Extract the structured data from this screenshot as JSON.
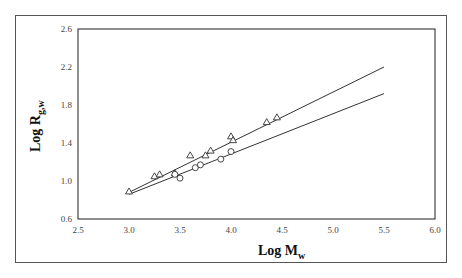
{
  "chart_data": {
    "type": "scatter",
    "title": "",
    "xlabel": "Log M_w",
    "ylabel": "Log R_g,w",
    "xlim": [
      2.5,
      6.0
    ],
    "ylim": [
      0.6,
      2.6
    ],
    "xticks": [
      "2.5",
      "3.0",
      "3.5",
      "4.0",
      "4.5",
      "5.0",
      "5.5",
      "6.0"
    ],
    "yticks": [
      "0.6",
      "1.0",
      "1.4",
      "1.8",
      "2.2",
      "2.6"
    ],
    "grid": false,
    "legend": null,
    "series": [
      {
        "name": "triangles",
        "marker": "triangle",
        "x": [
          3.0,
          3.25,
          3.3,
          3.45,
          3.6,
          3.75,
          3.8,
          4.0,
          4.02,
          4.35,
          4.45
        ],
        "y": [
          0.89,
          1.05,
          1.07,
          1.08,
          1.27,
          1.27,
          1.32,
          1.47,
          1.43,
          1.62,
          1.67
        ]
      },
      {
        "name": "circles",
        "marker": "circle",
        "x": [
          3.45,
          3.5,
          3.65,
          3.7,
          3.9,
          4.0
        ],
        "y": [
          1.07,
          1.03,
          1.14,
          1.17,
          1.23,
          1.31
        ]
      }
    ],
    "fit_lines": [
      {
        "name": "upper-fit",
        "x": [
          3.0,
          5.5
        ],
        "y": [
          0.88,
          2.2
        ]
      },
      {
        "name": "lower-fit",
        "x": [
          3.0,
          5.5
        ],
        "y": [
          0.86,
          1.92
        ]
      }
    ]
  },
  "labels": {
    "xlabel_main": "Log M",
    "xlabel_sub": "w",
    "ylabel_main": "Log R",
    "ylabel_sub": "g,w"
  }
}
